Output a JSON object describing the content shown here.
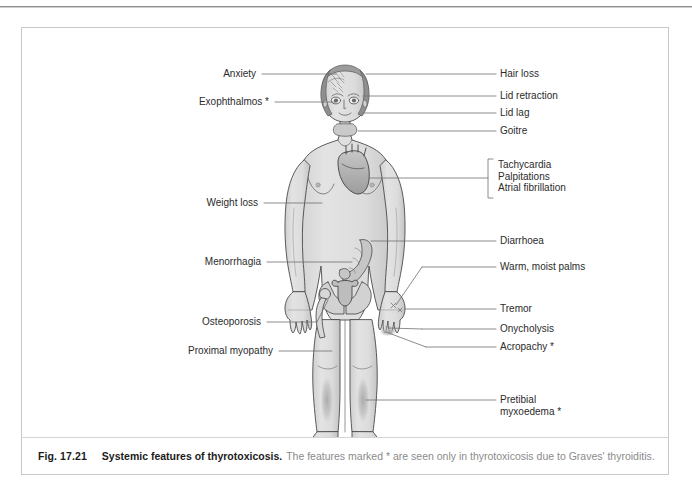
{
  "figure": {
    "number": "Fig. 17.21",
    "title": "Systemic features of thyrotoxicosis.",
    "description": "The features marked * are seen only in thyrotoxicosis due to Graves' thyroiditis."
  },
  "colors": {
    "border": "#c9c9c9",
    "leader_line": "#6e6e6e",
    "label_text": "#2b2b2b",
    "caption_bold": "#1b1b1b",
    "caption_light": "#8b8b8b",
    "body_fill": "#dcdcdc",
    "body_outline": "#4a4a4a",
    "organ_fill": "#b4b4b4",
    "shade": "#b0b0b0"
  },
  "labels_left": [
    {
      "id": "anxiety",
      "text": "Anxiety",
      "x": 236,
      "y": 46,
      "line_to_x": 310
    },
    {
      "id": "exophthalmos",
      "text": "Exophthalmos *",
      "x": 236,
      "y": 74,
      "line_to_x": 318
    },
    {
      "id": "weight-loss",
      "text": "Weight loss",
      "x": 236,
      "y": 175,
      "line_to_x": 300
    },
    {
      "id": "menorrhagia",
      "text": "Menorrhagia",
      "x": 236,
      "y": 234,
      "line_to_x": 336
    },
    {
      "id": "osteoporosis",
      "text": "Osteoporosis",
      "x": 236,
      "y": 294,
      "line_to_x": 318
    },
    {
      "id": "proximal-myopathy",
      "text": "Proximal myopathy",
      "x": 236,
      "y": 323,
      "line_to_x": 344
    }
  ],
  "labels_right": [
    {
      "id": "hair-loss",
      "text": "Hair loss",
      "x": 480,
      "y": 46,
      "line_from_x": 348
    },
    {
      "id": "lid-retraction",
      "text": "Lid retraction",
      "x": 480,
      "y": 68,
      "line_from_x": 352
    },
    {
      "id": "lid-lag",
      "text": "Lid lag",
      "x": 480,
      "y": 85,
      "line_from_x": 352
    },
    {
      "id": "goitre",
      "text": "Goitre",
      "x": 480,
      "y": 103,
      "line_from_x": 352
    },
    {
      "id": "diarrhoea",
      "text": "Diarrhoea",
      "x": 480,
      "y": 213,
      "line_from_x": 388
    },
    {
      "id": "warm-moist-palms",
      "text": "Warm, moist palms",
      "x": 480,
      "y": 239,
      "line_from_x": 418
    },
    {
      "id": "tremor",
      "text": "Tremor",
      "x": 480,
      "y": 281,
      "line_from_x": 418
    },
    {
      "id": "onycholysis",
      "text": "Onycholysis",
      "x": 480,
      "y": 301,
      "line_from_x": 418
    },
    {
      "id": "acropachy",
      "text": "Acropachy *",
      "x": 480,
      "y": 319,
      "line_from_x": 418
    }
  ],
  "label_group_cardiac": {
    "id": "cardiac-group",
    "items": [
      "Tachycardia",
      "Palpitations",
      "Atrial fibrillation"
    ],
    "x": 478,
    "y": 133,
    "bracket_x": 471,
    "bracket_top": 131,
    "bracket_bottom": 170,
    "line_from_x": 370,
    "line_y": 150
  },
  "label_multiline_right": {
    "id": "pretibial-myxoedema",
    "lines": [
      "Pretibial",
      "myxoedema *"
    ],
    "x": 480,
    "y": 372,
    "line_from_x": 358
  },
  "anatomy": {
    "figure_type": "anterior-female-body",
    "organs_shown": [
      "brain",
      "eyes",
      "thyroid-goitre",
      "heart",
      "intestines",
      "uterus",
      "pelvis",
      "femur"
    ],
    "shaded_regions": [
      "pretibial-shins",
      "fingernails"
    ]
  }
}
